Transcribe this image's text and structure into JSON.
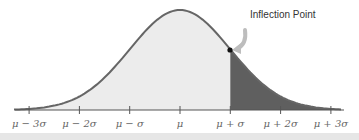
{
  "chart_data": {
    "type": "area",
    "xlabel": "",
    "ylabel": "",
    "x_ticks": [
      "μ − 3σ",
      "μ − 2σ",
      "μ − σ",
      "μ",
      "μ + σ",
      "μ + 2σ",
      "μ + 3σ"
    ],
    "x_tick_values_sigma": [
      -3,
      -2,
      -1,
      0,
      1,
      2,
      3
    ],
    "curve": "standard normal density",
    "shaded_regions": [
      {
        "name": "light",
        "from_sigma": -3,
        "to_sigma": 1,
        "color": "#e8e8e8"
      },
      {
        "name": "dark",
        "from_sigma": 1,
        "to_sigma": 3,
        "color": "#5e5e5e"
      }
    ],
    "annotations": [
      {
        "text": "Inflection Point",
        "at_sigma": 1,
        "marker": "dot with curved arrow"
      }
    ],
    "grid": false,
    "legend": "none"
  },
  "labels": {
    "annotation": "Inflection Point",
    "ticks": [
      "μ − 3σ",
      "μ − 2σ",
      "μ − σ",
      "μ",
      "μ + σ",
      "μ + 2σ",
      "μ + 3σ"
    ]
  },
  "colors": {
    "curve": "#666666",
    "light_fill": "#ececec",
    "dark_fill": "#5f5f5f",
    "axis": "#555555",
    "arrow": "#bdbdbd"
  }
}
